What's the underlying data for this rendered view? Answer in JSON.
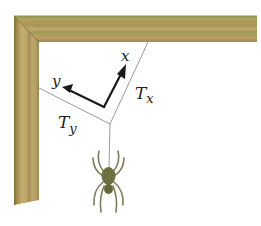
{
  "figure": {
    "labels": {
      "x_axis": "x",
      "y_axis": "y",
      "tension_x_main": "T",
      "tension_x_sub": "x",
      "tension_y_main": "T",
      "tension_y_sub": "y"
    },
    "colors": {
      "wood_base": "#b59a5a",
      "wood_dark": "#8c7a3e",
      "wood_light": "#cdb87c",
      "wood_green_tint": "#9aa060",
      "rope": "#9a9a9a",
      "axis_arrow": "#1a1a1a",
      "spider_body": "#6f7040",
      "spider_legs": "#7d7c58",
      "background": "#ffffff"
    }
  }
}
